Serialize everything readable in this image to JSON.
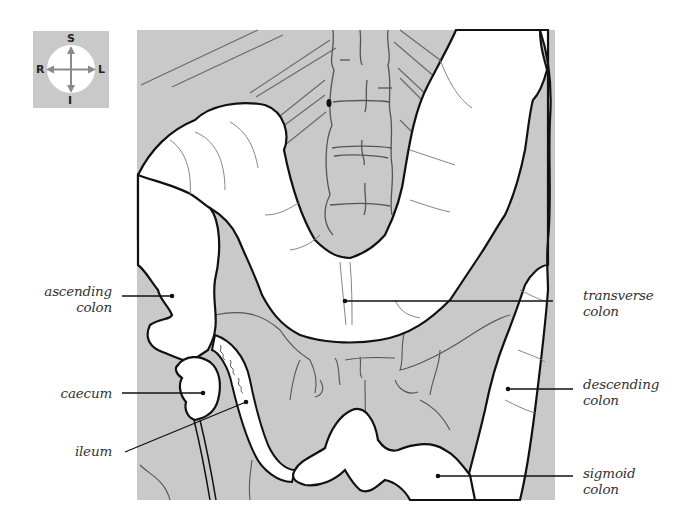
{
  "diagram": {
    "background_color": "#c9c9c9",
    "outline_color": "#111111",
    "organ_fill": "#ffffff"
  },
  "compass": {
    "superior": "S",
    "inferior": "I",
    "right": "R",
    "left": "L"
  },
  "labels": {
    "ascending_colon": {
      "line1": "ascending",
      "line2": "colon"
    },
    "caecum": {
      "line1": "caecum"
    },
    "ileum": {
      "line1": "ileum"
    },
    "transverse_colon": {
      "line1": "transverse",
      "line2": "colon"
    },
    "descending_colon": {
      "line1": "descending",
      "line2": "colon"
    },
    "sigmoid_colon": {
      "line1": "sigmoid",
      "line2": "colon"
    }
  }
}
